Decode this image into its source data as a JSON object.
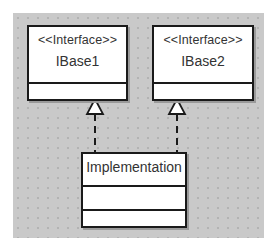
{
  "diagram": {
    "type": "UML class diagram",
    "classes": [
      {
        "id": "ibase1",
        "stereotype": "<<Interface>>",
        "name": "IBase1",
        "attributes": [],
        "operations": []
      },
      {
        "id": "ibase2",
        "stereotype": "<<Interface>>",
        "name": "IBase2",
        "attributes": [],
        "operations": []
      },
      {
        "id": "implementation",
        "stereotype": "",
        "name": "Implementation",
        "attributes": [],
        "operations": []
      }
    ],
    "relations": [
      {
        "from": "implementation",
        "to": "ibase1",
        "kind": "realization",
        "line": "dashed",
        "arrow": "hollow-triangle"
      },
      {
        "from": "implementation",
        "to": "ibase2",
        "kind": "realization",
        "line": "dashed",
        "arrow": "hollow-triangle"
      }
    ],
    "colors": {
      "canvas": "#c9c9c9",
      "box_fill": "#ffffff",
      "border": "#1a1a1a",
      "text": "#333333"
    }
  }
}
